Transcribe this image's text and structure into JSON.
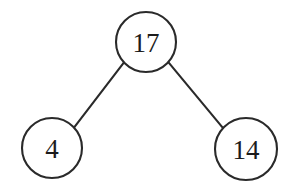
{
  "figure": {
    "kind": "binary-tree-diagram",
    "width": 288,
    "height": 185,
    "background_color": "#ffffff",
    "stroke_color": "#2a2a2a",
    "label_color": "#1c1c1c",
    "stroke_width": 2.1
  },
  "nodes": [
    {
      "id": "root",
      "label": "17",
      "role": "root",
      "cx": 146,
      "cy": 42,
      "r": 30
    },
    {
      "id": "left",
      "label": "4",
      "role": "left-child",
      "cx": 52,
      "cy": 148,
      "r": 30
    },
    {
      "id": "right",
      "label": "14",
      "role": "right-child",
      "cx": 246,
      "cy": 149,
      "r": 31
    }
  ],
  "edges": [
    {
      "id": "root-to-left",
      "from": "root",
      "to": "left",
      "x1": 124.0,
      "y1": 62.4,
      "x2": 74.0,
      "y2": 127.6
    },
    {
      "id": "root-to-right",
      "from": "root",
      "to": "right",
      "x1": 168.3,
      "y1": 62.2,
      "x2": 223.7,
      "y2": 128.8
    }
  ],
  "chart_data": {
    "type": "diagram",
    "title": "",
    "categories": [
      "17",
      "4",
      "14"
    ],
    "values": [
      17,
      4,
      14
    ]
  }
}
